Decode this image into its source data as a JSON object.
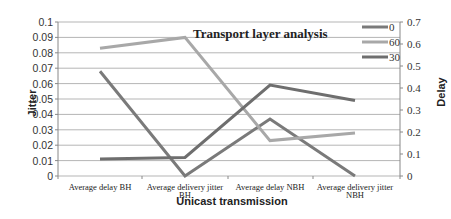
{
  "chart_data": {
    "type": "line",
    "title": "Transport layer analysis",
    "xlabel": "Unicast transmission",
    "ylabel": "Jitter",
    "ylabel_right": "Delay",
    "categories": [
      [
        "Average delay BH"
      ],
      [
        "Average delivery jitter",
        "BH"
      ],
      [
        "Average delay NBH"
      ],
      [
        "Average delivery jitter",
        "NBH"
      ]
    ],
    "yticks_left": [
      "0",
      "0.01",
      "0.02",
      "0.03",
      "0.04",
      "0.05",
      "0.06",
      "0.07",
      "0.08",
      "0.09",
      "0.1"
    ],
    "yticks_right": [
      "0",
      "0.1",
      "0.2",
      "0.3",
      "0.4",
      "0.5",
      "0.6",
      "0.7"
    ],
    "ylim_left": [
      0,
      0.1
    ],
    "ylim_right": [
      0,
      0.7
    ],
    "grid": true,
    "legend_position": "top-right",
    "series": [
      {
        "name": "0",
        "color": "#7a7a7a",
        "values_jitter_scale": [
          0.068,
          0.0,
          0.037,
          0.0
        ],
        "values_delay_scale": [
          0.48,
          0.0,
          0.26,
          0.0
        ]
      },
      {
        "name": "60",
        "color": "#a8a8a8",
        "values_jitter_scale": [
          0.083,
          0.09,
          0.023,
          0.028
        ],
        "values_delay_scale": [
          0.58,
          0.63,
          0.16,
          0.19
        ]
      },
      {
        "name": "30",
        "color": "#6e6e6e",
        "values_jitter_scale": [
          0.011,
          0.012,
          0.059,
          0.049
        ],
        "values_delay_scale": [
          0.08,
          0.085,
          0.6,
          0.345
        ]
      }
    ]
  }
}
